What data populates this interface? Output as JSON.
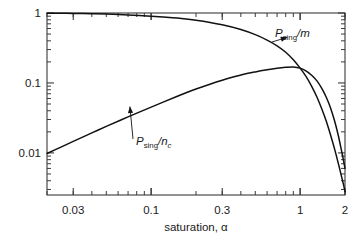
{
  "chart_data": {
    "type": "line",
    "title": "",
    "subtitle": "",
    "xlabel": "saturation, α",
    "ylabel": "",
    "xscale": "log",
    "yscale": "log",
    "xlim": [
      0.02,
      2
    ],
    "ylim": [
      0.0025,
      1
    ],
    "grid": false,
    "legend_position": "inline-annotations",
    "x_tick_labels": [
      "0.03",
      "0.1",
      "0.3",
      "1",
      "2"
    ],
    "x_tick_values": [
      0.03,
      0.1,
      0.3,
      1,
      2
    ],
    "y_tick_labels": [
      "1",
      "0.1",
      "0.01"
    ],
    "y_tick_values": [
      1,
      0.1,
      0.01
    ],
    "annotations": [
      {
        "name": "psing-over-m",
        "text_main": "P",
        "text_sub": "sing",
        "text_tail": "/m",
        "label_full": "P_sing /m",
        "points_to_x": 0.82,
        "points_to_y": 0.45
      },
      {
        "name": "psing-over-nc",
        "text_main": "P",
        "text_sub": "sing",
        "text_tail": "/n",
        "text_tail_sub": "c",
        "label_full": "P_sing /n_c",
        "points_to_x": 0.072,
        "points_to_y": 0.046
      }
    ],
    "series": [
      {
        "name": "P_sing /m",
        "x": [
          0.02,
          0.025,
          0.03,
          0.04,
          0.05,
          0.07,
          0.1,
          0.15,
          0.2,
          0.3,
          0.4,
          0.5,
          0.6,
          0.7,
          0.8,
          0.9,
          1.0,
          1.1,
          1.2,
          1.3,
          1.4,
          1.5,
          1.6,
          1.7,
          1.8,
          1.9,
          1.95,
          2.0
        ],
        "y": [
          0.995,
          0.99,
          0.985,
          0.975,
          0.965,
          0.94,
          0.9,
          0.845,
          0.79,
          0.68,
          0.58,
          0.49,
          0.41,
          0.34,
          0.275,
          0.215,
          0.163,
          0.122,
          0.088,
          0.062,
          0.042,
          0.028,
          0.018,
          0.0115,
          0.0072,
          0.0045,
          0.0036,
          0.0028
        ]
      },
      {
        "name": "P_sing /n_c",
        "x": [
          0.02,
          0.025,
          0.03,
          0.04,
          0.05,
          0.07,
          0.1,
          0.15,
          0.2,
          0.3,
          0.4,
          0.5,
          0.6,
          0.7,
          0.8,
          0.9,
          1.0,
          1.1,
          1.2,
          1.3,
          1.4,
          1.5,
          1.6,
          1.7,
          1.8,
          1.9,
          1.95,
          2.0
        ],
        "y": [
          0.0098,
          0.0122,
          0.0146,
          0.0193,
          0.0239,
          0.0327,
          0.0452,
          0.0645,
          0.0818,
          0.1095,
          0.1295,
          0.1438,
          0.1545,
          0.1625,
          0.1675,
          0.1695,
          0.163,
          0.148,
          0.128,
          0.106,
          0.083,
          0.062,
          0.044,
          0.029,
          0.018,
          0.0105,
          0.008,
          0.006
        ]
      }
    ]
  },
  "figure": {
    "name": "log-log-plot",
    "background": "#ffffff",
    "axis_color": "#3a3a3a",
    "curve_color": "#111111"
  }
}
